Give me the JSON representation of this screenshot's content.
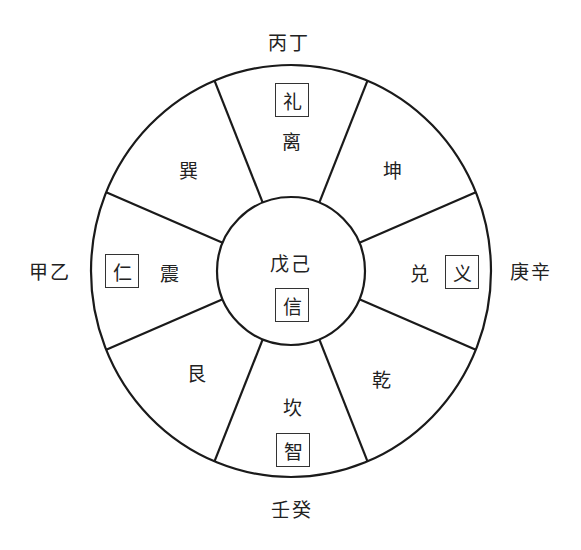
{
  "diagram": {
    "type": "eight-trigram-wheel",
    "colors": {
      "stroke": "#1a1a1a",
      "text": "#222222",
      "background": "#ffffff"
    },
    "geometry": {
      "cx": 291,
      "cy": 271,
      "outer_rx": 200,
      "outer_ry": 206,
      "inner_r": 74
    },
    "outer_labels": {
      "top": "丙丁",
      "bottom": "壬癸",
      "left": "甲乙",
      "right": "庚辛"
    },
    "center": {
      "stems": "戊己",
      "virtue": "信"
    },
    "sectors": [
      {
        "position": "top",
        "trigram": "离",
        "virtue": "礼"
      },
      {
        "position": "top-right",
        "trigram": "坤",
        "virtue": null
      },
      {
        "position": "right",
        "trigram": "兑",
        "virtue": "义"
      },
      {
        "position": "bottom-right",
        "trigram": "乾",
        "virtue": null
      },
      {
        "position": "bottom",
        "trigram": "坎",
        "virtue": "智"
      },
      {
        "position": "bottom-left",
        "trigram": "艮",
        "virtue": null
      },
      {
        "position": "left",
        "trigram": "震",
        "virtue": "仁"
      },
      {
        "position": "top-left",
        "trigram": "巽",
        "virtue": null
      }
    ]
  }
}
